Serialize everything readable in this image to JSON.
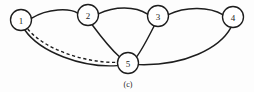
{
  "figure": {
    "caption": "(c)",
    "caption_x": 128,
    "caption_y": 84,
    "width": 254,
    "height": 92,
    "background_color": "#fdfdfd",
    "ink_color": "#1d1d1d"
  },
  "chart_data": {
    "type": "diagram",
    "title": "(c)",
    "diagram_kind": "undirected-graph",
    "node_radius": 10.5,
    "nodes": [
      {
        "id": "1",
        "label": "1",
        "x": 21,
        "y": 20
      },
      {
        "id": "2",
        "label": "2",
        "x": 88,
        "y": 15
      },
      {
        "id": "3",
        "label": "3",
        "x": 158,
        "y": 16
      },
      {
        "id": "4",
        "label": "4",
        "x": 233,
        "y": 17
      },
      {
        "id": "5",
        "label": "5",
        "x": 128,
        "y": 63
      }
    ],
    "edges": [
      {
        "from": "1",
        "to": "2",
        "style": "solid",
        "path": "M 31.3 18.3 C 48 8, 70 8, 77.7 13.2"
      },
      {
        "from": "2",
        "to": "3",
        "style": "solid",
        "path": "M 98.4 13.8 C 115 6, 135 6, 147.6 14.2"
      },
      {
        "from": "3",
        "to": "4",
        "style": "solid",
        "path": "M 168.4 14.6 C 186 6, 210 7, 222.7 14.6"
      },
      {
        "from": "2",
        "to": "5",
        "style": "solid",
        "path": "M 92.5 25.2 C 102 38, 112 50, 119.5 56.8"
      },
      {
        "from": "3",
        "to": "5",
        "style": "solid",
        "path": "M 154.0 26.2 C 148 38, 142 50, 136.0 57.6"
      },
      {
        "from": "4",
        "to": "5",
        "style": "solid",
        "path": "M 231.0 27.4 C 220 48, 185 66, 138.6 64.6"
      },
      {
        "from": "1",
        "to": "5",
        "style": "solid",
        "path": "M 24.8 30.0 C 40 52, 82 68, 117.4 65.6"
      },
      {
        "from": "1",
        "to": "5",
        "style": "dashed",
        "path": "M 27.8 29.0 C 44 49, 84 63, 117.6 62.4"
      }
    ],
    "legend": [],
    "annotations": []
  }
}
